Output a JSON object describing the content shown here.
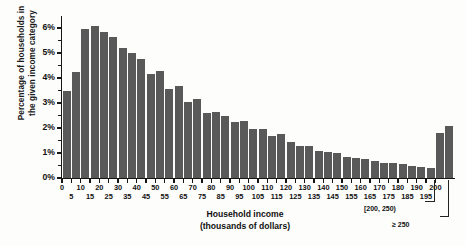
{
  "chart_data": {
    "type": "bar",
    "title": "",
    "xlabel": "Household income\n(thousands of dollars)",
    "ylabel": "Percentage of households in\nthe given income category",
    "ylim": [
      0,
      6.4
    ],
    "ytick_values": [
      0,
      1,
      2,
      3,
      4,
      5,
      6
    ],
    "ytick_labels": [
      "0%",
      "1%",
      "2%",
      "3%",
      "4%",
      "5%",
      "6%"
    ],
    "grid": false,
    "legend": "none",
    "bar_color": "#595959",
    "axis_color": "#161616",
    "xtick_values": [
      0,
      5,
      10,
      15,
      20,
      25,
      30,
      35,
      40,
      45,
      50,
      55,
      60,
      65,
      70,
      75,
      80,
      85,
      90,
      95,
      100,
      105,
      110,
      115,
      120,
      125,
      130,
      135,
      140,
      145,
      150,
      155,
      160,
      165,
      170,
      175,
      180,
      185,
      190,
      195,
      200
    ],
    "xtick_labels": [
      "0",
      "5",
      "10",
      "15",
      "20",
      "25",
      "30",
      "35",
      "40",
      "45",
      "50",
      "55",
      "60",
      "65",
      "70",
      "75",
      "80",
      "85",
      "90",
      "95",
      "100",
      "105",
      "110",
      "115",
      "120",
      "125",
      "130",
      "135",
      "140",
      "145",
      "150",
      "155",
      "160",
      "165",
      "170",
      "175",
      "180",
      "185",
      "190",
      "195",
      "200"
    ],
    "bin_width": 5,
    "categories": [
      "0-5",
      "5-10",
      "10-15",
      "15-20",
      "20-25",
      "25-30",
      "30-35",
      "35-40",
      "40-45",
      "45-50",
      "50-55",
      "55-60",
      "60-65",
      "65-70",
      "70-75",
      "75-80",
      "80-85",
      "85-90",
      "90-95",
      "95-100",
      "100-105",
      "105-110",
      "110-115",
      "115-120",
      "120-125",
      "125-130",
      "130-135",
      "135-140",
      "140-145",
      "145-150",
      "150-155",
      "155-160",
      "160-165",
      "165-170",
      "170-175",
      "175-180",
      "180-185",
      "185-190",
      "190-195",
      "195-200",
      "[200, 250)",
      "≥ 250"
    ],
    "values": [
      3.5,
      4.25,
      5.95,
      6.1,
      5.85,
      5.65,
      5.2,
      5.0,
      4.75,
      4.15,
      4.3,
      3.55,
      3.7,
      3.05,
      3.15,
      2.6,
      2.65,
      2.5,
      2.25,
      2.3,
      1.95,
      1.95,
      1.7,
      1.75,
      1.45,
      1.3,
      1.3,
      1.1,
      1.05,
      1.0,
      0.85,
      0.8,
      0.75,
      0.7,
      0.6,
      0.6,
      0.55,
      0.5,
      0.45,
      0.4,
      1.8,
      2.1
    ],
    "annotations": [
      {
        "text": "[200, 250)",
        "target_bin": "[200, 250)"
      },
      {
        "text": "≥ 250",
        "target_bin": "≥ 250"
      }
    ]
  }
}
